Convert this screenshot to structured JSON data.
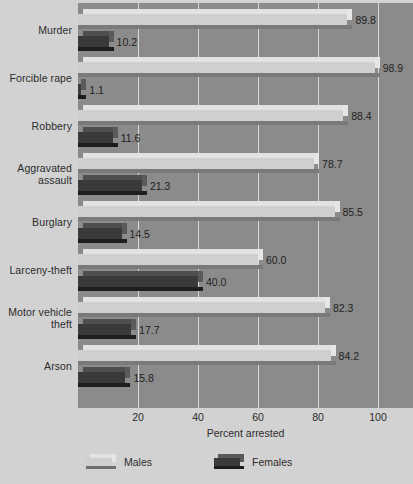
{
  "chart_data": {
    "type": "bar",
    "orientation": "horizontal",
    "title": "",
    "xlabel": "Percent arrested",
    "ylabel": "",
    "xlim": [
      0,
      112
    ],
    "xticks": [
      20,
      40,
      60,
      80,
      100
    ],
    "xtick_labels": [
      "20",
      "40",
      "60",
      "80",
      "100"
    ],
    "grid": true,
    "legend_position": "bottom-left",
    "categories": [
      "Murder",
      "Forcible rape",
      "Robbery",
      "Aggravated assault",
      "Burglary",
      "Larceny-theft",
      "Motor vehicle theft",
      "Arson"
    ],
    "series": [
      {
        "name": "Males",
        "color": "#cfcfcf",
        "values": [
          89.8,
          98.9,
          88.4,
          78.7,
          85.5,
          60.0,
          82.3,
          84.2
        ],
        "labels": [
          "89.8",
          "98.9",
          "88.4",
          "78.7",
          "85.5",
          "60.0",
          "82.3",
          "84.2"
        ]
      },
      {
        "name": "Females",
        "color": "#3a3a3a",
        "values": [
          10.2,
          1.1,
          11.6,
          21.3,
          14.5,
          40.0,
          17.7,
          15.8
        ],
        "labels": [
          "10.2",
          "1.1",
          "11.6",
          "21.3",
          "14.5",
          "40.0",
          "17.7",
          "15.8"
        ]
      }
    ]
  },
  "axis": {
    "title": "Percent arrested",
    "ticks": [
      "20",
      "40",
      "60",
      "80",
      "100"
    ]
  },
  "category_labels": [
    {
      "line1": "Murder",
      "line2": ""
    },
    {
      "line1": "Forcible rape",
      "line2": ""
    },
    {
      "line1": "Robbery",
      "line2": ""
    },
    {
      "line1": "Aggravated",
      "line2": "assault"
    },
    {
      "line1": "Burglary",
      "line2": ""
    },
    {
      "line1": "Larceny-theft",
      "line2": ""
    },
    {
      "line1": "Motor vehicle",
      "line2": "theft"
    },
    {
      "line1": "Arson",
      "line2": ""
    }
  ],
  "legend": {
    "items": [
      {
        "label": "Males",
        "swatch": "males-swatch"
      },
      {
        "label": "Females",
        "swatch": "females-swatch"
      }
    ]
  },
  "colors": {
    "panel": "#8b8b8b",
    "background": "#d2d2d2",
    "gridline": "#d8d8d8",
    "males": "#cfcfcf",
    "females": "#3a3a3a",
    "text": "#2c2c2c"
  }
}
